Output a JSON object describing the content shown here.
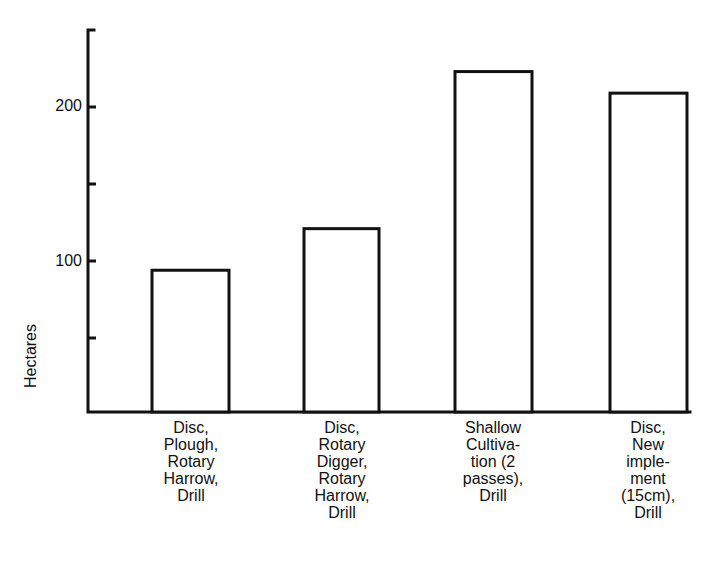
{
  "chart_data": {
    "type": "bar",
    "title": "",
    "xlabel": "",
    "ylabel": "Hectares",
    "ylim": [
      0,
      250
    ],
    "yticks": [
      50,
      100,
      150,
      200,
      250
    ],
    "ytick_labels": [
      "100",
      "200"
    ],
    "grid": false,
    "legend": null,
    "categories": [
      "Disc,\nPlough,\nRotary\nHarrow,\nDrill",
      "Disc,\nRotary\nDigger,\nRotary\nHarrow,\nDrill",
      "Shallow\nCultiva-\ntion (2\npasses),\nDrill",
      "Disc,\nNew\nimple-\nment\n(15cm),\nDrill"
    ],
    "values": [
      94,
      121,
      223,
      209
    ]
  },
  "axis": {
    "label_100": "100",
    "label_200": "200",
    "ylabel": "Hectares"
  },
  "colors": {
    "line": "#111111",
    "fill": "#ffffff"
  }
}
